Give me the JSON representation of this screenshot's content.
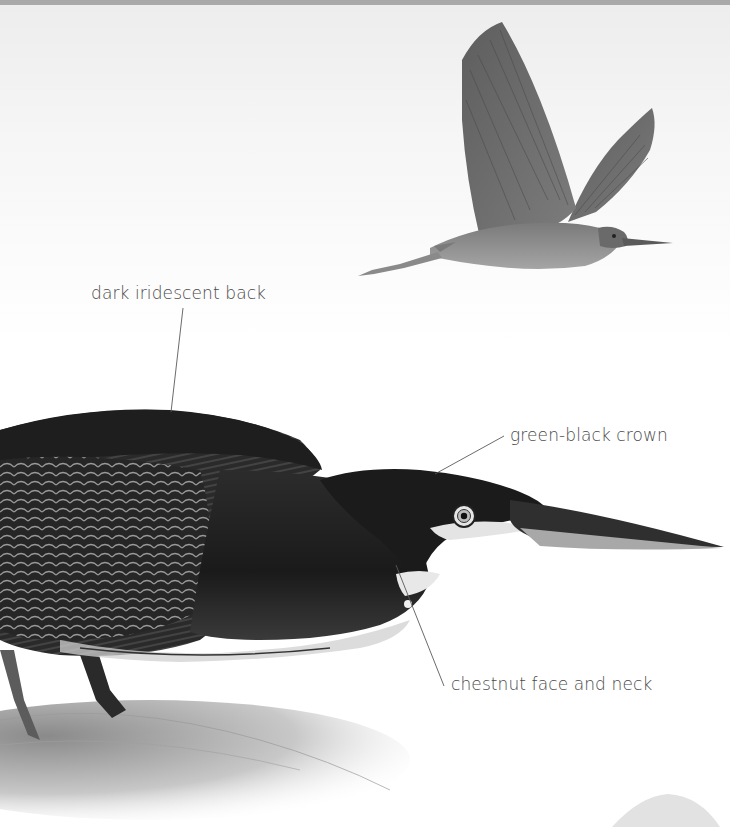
{
  "illustration": {
    "subject": "Green Heron",
    "figures": [
      "heron-in-flight",
      "heron-stalking"
    ]
  },
  "labels": [
    {
      "id": "back",
      "text": "dark iridescent back"
    },
    {
      "id": "crown",
      "text": "green-black crown"
    },
    {
      "id": "face",
      "text": "chestnut face and neck"
    }
  ],
  "colors": {
    "label_text": "#4a4a4a",
    "leader_line": "#5a5a5a",
    "background": "#ffffff",
    "top_band": "#a9a9a9"
  }
}
